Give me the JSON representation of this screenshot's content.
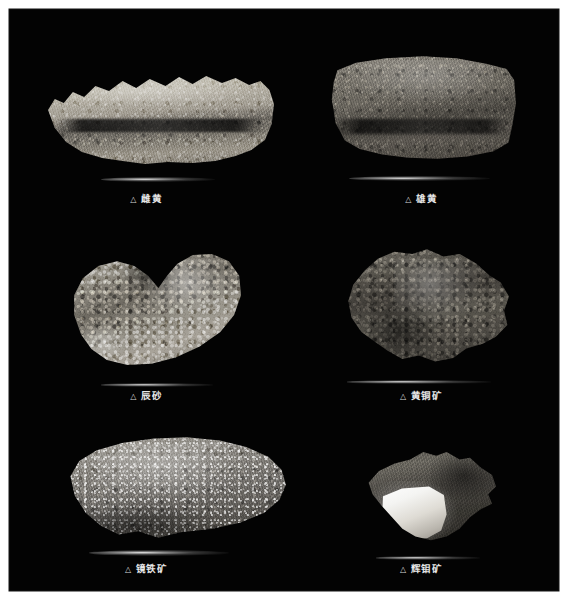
{
  "plate": {
    "background_color": "#030303",
    "paper_color": "#ffffff",
    "caption_color": "#e8e8e8",
    "marker_glyph": "△",
    "marker_name": "triangle-marker-icon"
  },
  "specimens": [
    {
      "index": 1,
      "marker": "△",
      "label": "雌黄",
      "icon_name": "mineral-specimen-photo",
      "row": 1,
      "column": 1,
      "description": "elongated tabular slab, jagged upper edge, pale grey-tan"
    },
    {
      "index": 2,
      "marker": "△",
      "label": "雄黄",
      "icon_name": "mineral-specimen-photo",
      "row": 1,
      "column": 2,
      "description": "blocky rectangular slab, rough granular surface, mid grey"
    },
    {
      "index": 3,
      "marker": "△",
      "label": "辰砂",
      "icon_name": "mineral-specimen-photo",
      "row": 2,
      "column": 1,
      "description": "boomerang shaped crystalline druse, bright crystal faces"
    },
    {
      "index": 4,
      "marker": "△",
      "label": "黄铜矿",
      "icon_name": "mineral-specimen-photo",
      "row": 2,
      "column": 2,
      "description": "irregular knobby dark metallic aggregate"
    },
    {
      "index": 5,
      "marker": "△",
      "label": "镜铁矿",
      "icon_name": "mineral-specimen-photo",
      "row": 3,
      "column": 1,
      "description": "large flat oval slab, sparkling micaceous surface"
    },
    {
      "index": 6,
      "marker": "△",
      "label": "辉钼矿",
      "icon_name": "mineral-specimen-photo",
      "row": 3,
      "column": 2,
      "description": "dark bladed mass with bright reflective metallic cleavage face"
    }
  ]
}
